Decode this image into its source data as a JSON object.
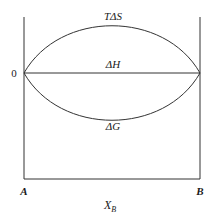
{
  "diagram": {
    "title": "",
    "curves": [
      {
        "id": "TdS",
        "label": "TΔS",
        "shape": "upper-arc"
      },
      {
        "id": "dH",
        "label": "ΔH",
        "shape": "straight-line"
      },
      {
        "id": "dG",
        "label": "ΔG",
        "shape": "lower-arc"
      }
    ],
    "y_axis": {
      "zero_label": "0"
    },
    "x_axis": {
      "left_label": "A",
      "right_label": "B",
      "label_main": "X",
      "label_sub": "B"
    },
    "colors": {
      "line": "#333333",
      "text": "#1a1a1a",
      "background": "#ffffff"
    }
  }
}
